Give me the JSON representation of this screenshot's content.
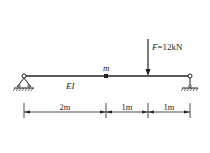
{
  "diagram": {
    "type": "simply-supported-beam",
    "beam_label": "EI",
    "mass_label": "m",
    "force": {
      "symbol": "F",
      "value_text": "=12kN"
    },
    "dimensions": [
      {
        "label": "2m"
      },
      {
        "label": "1m"
      },
      {
        "label": "1m"
      }
    ],
    "supports": [
      "pin-left",
      "roller-right"
    ],
    "colors": {
      "line": "#222222",
      "background": "#ffffff"
    }
  }
}
